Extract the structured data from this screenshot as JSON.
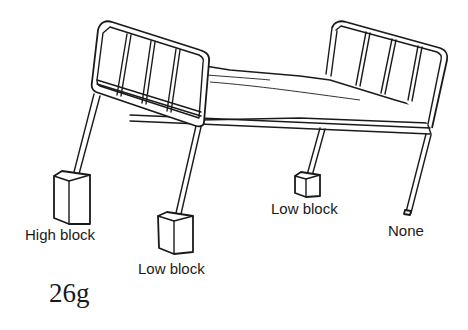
{
  "figure": {
    "label": "26g"
  },
  "labels": {
    "front_left": "High block",
    "front_right": "Low block",
    "back_left": "Low block",
    "back_right": "None"
  }
}
